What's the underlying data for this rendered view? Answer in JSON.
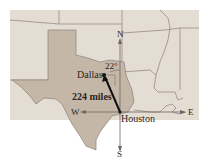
{
  "map": {
    "region": "Texas and neighboring states",
    "colors": {
      "background": "#ffffff",
      "other_states": "#e4ddd4",
      "texas": "#c4b7a8",
      "border": "#8c8078",
      "vector": "#111111",
      "axes": "#6f6660"
    }
  },
  "compass": {
    "north": "N",
    "south": "S",
    "east": "E",
    "west": "W"
  },
  "cities": {
    "origin": "Houston",
    "destination": "Dallas"
  },
  "annotation": {
    "distance": "224 miles",
    "angle": "22°"
  }
}
